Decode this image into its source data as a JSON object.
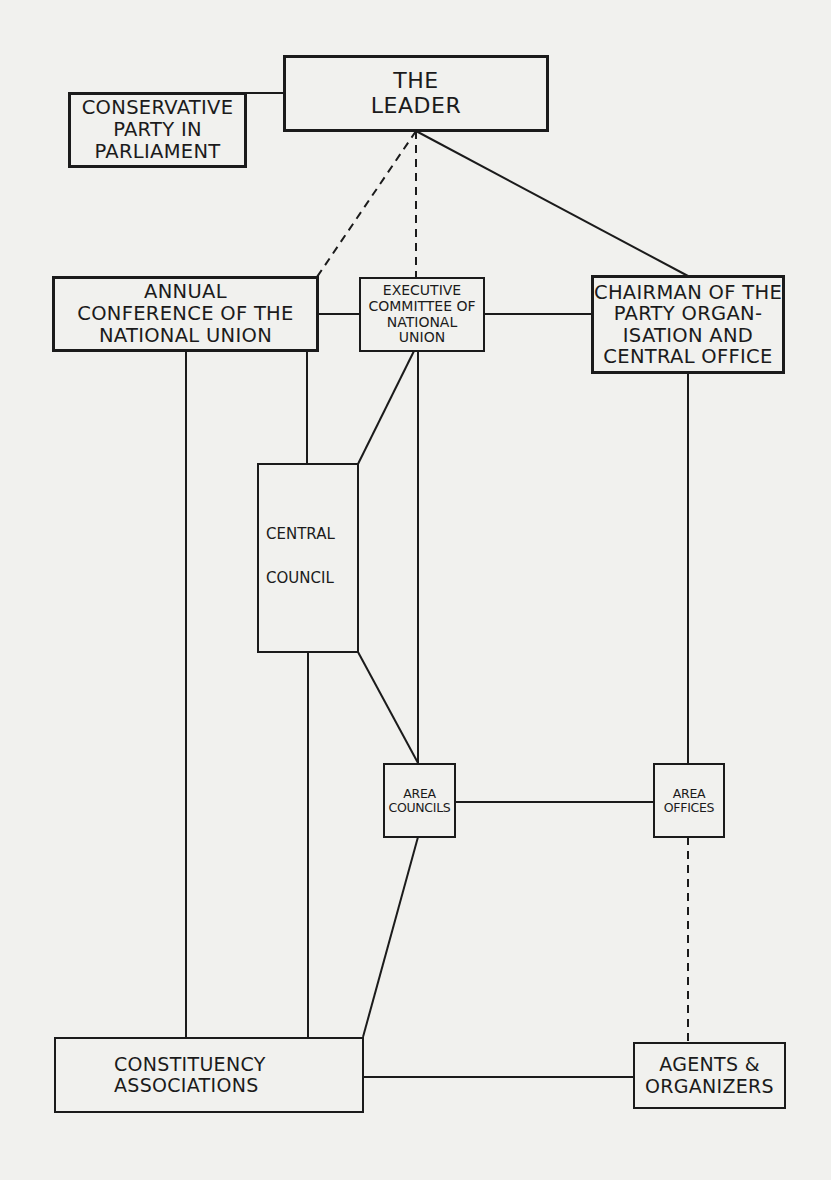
{
  "diagram": {
    "nodes": {
      "leader": {
        "lines": [
          "THE",
          "LEADER"
        ]
      },
      "parliament": {
        "lines": [
          "CONSERVATIVE",
          "PARTY IN",
          "PARLIAMENT"
        ]
      },
      "conference": {
        "lines": [
          "ANNUAL",
          "CONFERENCE OF THE",
          "NATIONAL UNION"
        ]
      },
      "executive": {
        "lines": [
          "EXECUTIVE",
          "COMMITTEE OF",
          "NATIONAL",
          "UNION"
        ]
      },
      "chairman": {
        "lines": [
          "CHAIRMAN OF THE",
          "PARTY ORGAN-",
          "ISATION AND",
          "CENTRAL OFFICE"
        ]
      },
      "central_council": {
        "lines": [
          "CENTRAL",
          "COUNCIL"
        ]
      },
      "area_councils": {
        "lines": [
          "AREA",
          "COUNCILS"
        ]
      },
      "area_offices": {
        "lines": [
          "AREA",
          "OFFICES"
        ]
      },
      "constituency": {
        "lines": [
          "CONSTITUENCY",
          "ASSOCIATIONS"
        ]
      },
      "agents": {
        "lines": [
          "AGENTS &",
          "ORGANIZERS"
        ]
      }
    },
    "edges": [
      {
        "from": "parliament",
        "to": "leader",
        "style": "solid"
      },
      {
        "from": "leader",
        "to": "conference",
        "style": "dashed"
      },
      {
        "from": "leader",
        "to": "executive",
        "style": "dashed"
      },
      {
        "from": "leader",
        "to": "chairman",
        "style": "solid"
      },
      {
        "from": "conference",
        "to": "executive",
        "style": "solid"
      },
      {
        "from": "executive",
        "to": "chairman",
        "style": "solid"
      },
      {
        "from": "conference",
        "to": "constituency",
        "style": "solid"
      },
      {
        "from": "conference",
        "to": "central_council",
        "style": "solid"
      },
      {
        "from": "executive",
        "to": "central_council",
        "style": "solid"
      },
      {
        "from": "executive",
        "to": "area_councils",
        "style": "solid"
      },
      {
        "from": "central_council",
        "to": "constituency",
        "style": "solid"
      },
      {
        "from": "central_council",
        "to": "area_councils",
        "style": "solid"
      },
      {
        "from": "area_councils",
        "to": "constituency",
        "style": "solid"
      },
      {
        "from": "area_councils",
        "to": "area_offices",
        "style": "solid"
      },
      {
        "from": "chairman",
        "to": "area_offices",
        "style": "solid"
      },
      {
        "from": "area_offices",
        "to": "agents",
        "style": "dashed"
      },
      {
        "from": "constituency",
        "to": "agents",
        "style": "solid"
      }
    ],
    "colors": {
      "ink": "#1b1b1b",
      "paper": "#f1f1ee",
      "bleed_text": "#dcdcd8"
    }
  }
}
